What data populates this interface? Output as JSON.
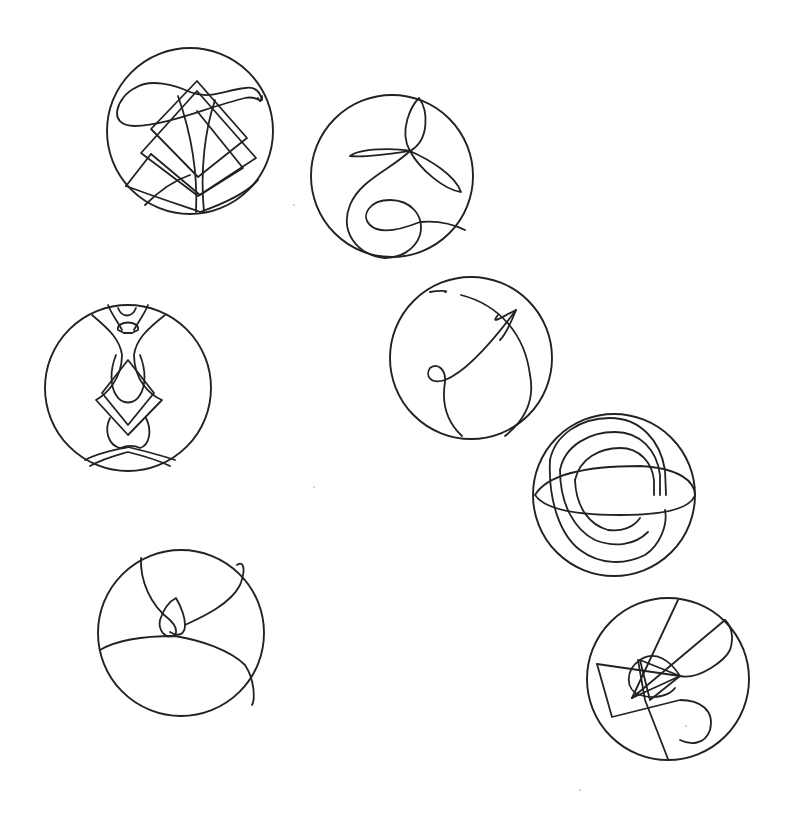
{
  "canvas": {
    "width": 791,
    "height": 819,
    "background": "#ffffff",
    "ink": "#222222"
  },
  "glyphs": [
    {
      "name": "glyph-nested-diamonds",
      "cx": 190,
      "cy": 131,
      "r": 83,
      "paths": [
        "M135,88 C118,96 105,126 135,126 C165,126 205,108 245,98 C258,95 262,105 262,98 C262,90 262,108 258,98",
        "M135,88 C150,78 175,85 190,92 C210,100 225,90 245,88 C255,86 260,92 262,100",
        "M197,81 L247,138 L198,177 L151,129 Z",
        "M197,91 L256,158 L198,196 L141,153 Z",
        "M197,111 L243,168 L200,195 L151,154",
        "M126,186 L151,154",
        "M126,186 C150,195 180,205 200,212 C220,205 245,195 258,180",
        "M178,96 C190,130 198,170 196,212",
        "M215,100 C205,130 200,170 204,212",
        "M145,205 C160,190 175,180 190,175"
      ]
    },
    {
      "name": "glyph-trefoil-spiral",
      "cx": 392,
      "cy": 176,
      "r": 81,
      "paths": [
        "M410,151 C398,130 412,105 419,98 C428,110 430,140 410,151",
        "M410,151 C390,154 365,158 350,156 C360,148 395,148 410,151",
        "M410,151 C430,160 455,175 461,192 C445,190 420,170 410,151",
        "M410,151 C390,170 360,180 350,205 C340,230 355,255 385,258",
        "M385,258 C400,258 415,250 420,235 C425,215 410,200 390,200 C370,200 360,215 370,225 C380,235 400,230 420,222 C440,220 455,225 465,230"
      ]
    },
    {
      "name": "glyph-mirrored-figure",
      "cx": 128,
      "cy": 388,
      "r": 83,
      "paths": [
        "M92,315 C110,330 120,340 122,355 C122,380 105,395 96,400 L128,435 L162,400 C150,395 134,380 134,355 C136,340 146,330 165,315",
        "M118,308 C122,318 132,318 136,308",
        "M118,330 C116,320 140,320 138,330 L132,333 L124,333 Z",
        "M116,355 C110,370 110,385 116,395 C122,405 134,405 140,395 C146,385 146,370 140,355",
        "M102,393 L128,360 L154,393 L128,425 Z",
        "M110,418 C104,430 108,445 120,448 C128,445 134,445 140,448 C150,445 152,430 146,418",
        "M85,460 C100,452 115,450 128,447 C140,450 160,455 175,460",
        "M90,466 C105,458 118,455 128,452 C140,455 158,460 170,466",
        "M108,305 C112,315 118,322 122,330",
        "M148,305 C144,315 138,322 134,330"
      ]
    },
    {
      "name": "glyph-arrow-loop",
      "cx": 471,
      "cy": 358,
      "r": 81,
      "paths": [
        "M430,292 C440,290 450,291 445,292",
        "M461,295 C500,305 525,335 530,375 C535,400 525,420 505,436",
        "M516,310 C500,318 490,325 498,315 M516,310 C510,325 505,335 500,340",
        "M516,310 C490,345 465,372 445,380 C430,385 425,375 430,368 C438,362 446,370 445,382 C442,400 445,420 462,436"
      ]
    },
    {
      "name": "glyph-orbit-rings",
      "cx": 614,
      "cy": 495,
      "r": 81,
      "paths": [
        "M535,495 C550,470 600,466 640,466 C680,468 695,482 695,495 C690,510 660,515 620,515 C580,515 545,510 535,495",
        "M550,460 C555,435 580,418 610,418 C640,418 660,440 665,470 L666,495",
        "M560,470 C565,445 590,432 615,432 C640,432 657,450 660,475 L660,495",
        "M575,480 C580,458 600,448 620,448 C640,448 652,463 654,480 L654,495",
        "M550,460 C548,500 560,535 580,550 C600,565 625,565 645,555 C660,545 668,525 665,510",
        "M560,470 C560,505 575,530 595,540 C615,548 635,545 648,532",
        "M575,480 C576,508 590,525 608,530 C622,532 634,527 640,518"
      ]
    },
    {
      "name": "glyph-teardrop-knot",
      "cx": 181,
      "cy": 633,
      "r": 83,
      "paths": [
        "M141,558 C140,580 150,605 170,620 C175,625 178,630 175,635",
        "M175,635 C165,640 158,630 160,620 C165,605 172,600 176,598 C180,605 185,615 185,625 C185,635 178,637 170,632",
        "M185,625 C200,618 230,605 240,585 C246,570 244,560 237,565",
        "M100,650 C120,638 150,636 175,636 C200,640 230,650 245,665 C255,680 255,700 252,705"
      ]
    },
    {
      "name": "glyph-star-swirl",
      "cx": 668,
      "cy": 679,
      "r": 81,
      "paths": [
        "M597,664 L612,717 L680,700 C700,700 715,710 710,730 C705,745 690,745 680,740",
        "M597,664 L680,676",
        "M680,676 L632,698",
        "M680,676 C700,680 725,660 730,650 C735,635 730,625 725,620",
        "M725,620 L632,698",
        "M678,600 L632,698",
        "M640,660 C655,650 670,660 680,676",
        "M638,660 L645,700 L668,759",
        "M640,660 L680,676 L650,700 L640,660",
        "M640,660 C625,670 625,690 640,695 C655,700 670,695 675,688"
      ]
    }
  ],
  "specks": [
    {
      "x": 294,
      "y": 205
    },
    {
      "x": 314,
      "y": 487
    },
    {
      "x": 686,
      "y": 726
    },
    {
      "x": 580,
      "y": 790
    }
  ]
}
